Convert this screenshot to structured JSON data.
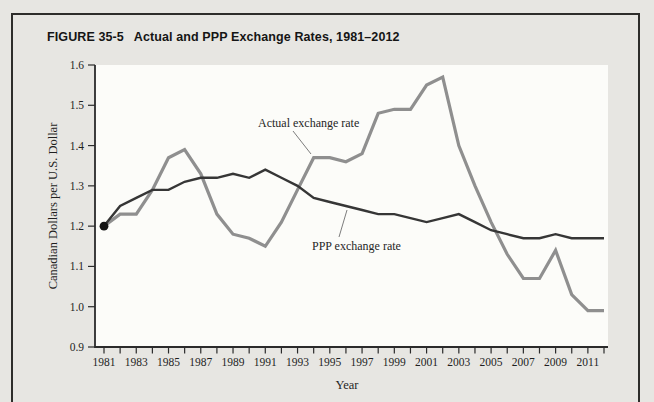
{
  "figure": {
    "label": "FIGURE 35-5",
    "title": "Actual and PPP Exchange Rates, 1981–2012"
  },
  "chart_data": {
    "type": "line",
    "title": "Actual and PPP Exchange Rates, 1981–2012",
    "xlabel": "Year",
    "ylabel": "Canadian Dollars per U.S. Dollar",
    "xlim": [
      1981,
      2012
    ],
    "ylim": [
      0.9,
      1.6
    ],
    "grid": false,
    "legend_position": "inline-annotations",
    "y_tick_labels": [
      "1.6",
      "1.5",
      "1.4",
      "1.3",
      "1.2",
      "1.1",
      "1.0",
      "0.9"
    ],
    "x_tick_labels": [
      "1981",
      "1983",
      "1985",
      "1987",
      "1989",
      "1991",
      "1993",
      "1995",
      "1997",
      "1999",
      "2001",
      "2003",
      "2005",
      "2007",
      "2009",
      "2011"
    ],
    "x_minor_tick_every_year": true,
    "years": [
      1981,
      1982,
      1983,
      1984,
      1985,
      1986,
      1987,
      1988,
      1989,
      1990,
      1991,
      1992,
      1993,
      1994,
      1995,
      1996,
      1997,
      1998,
      1999,
      2000,
      2001,
      2002,
      2003,
      2004,
      2005,
      2006,
      2007,
      2008,
      2009,
      2010,
      2011,
      2012
    ],
    "series": [
      {
        "name": "Actual exchange rate",
        "color": "#8f8f8f",
        "stroke_width": 3.2,
        "values": [
          1.2,
          1.23,
          1.23,
          1.29,
          1.37,
          1.39,
          1.33,
          1.23,
          1.18,
          1.17,
          1.15,
          1.21,
          1.29,
          1.37,
          1.37,
          1.36,
          1.38,
          1.48,
          1.49,
          1.49,
          1.55,
          1.57,
          1.4,
          1.3,
          1.21,
          1.13,
          1.07,
          1.07,
          1.14,
          1.03,
          0.99,
          0.99
        ]
      },
      {
        "name": "PPP exchange rate",
        "color": "#363636",
        "stroke_width": 2.4,
        "values": [
          1.2,
          1.25,
          1.27,
          1.29,
          1.29,
          1.31,
          1.32,
          1.32,
          1.33,
          1.32,
          1.34,
          1.32,
          1.3,
          1.27,
          1.26,
          1.25,
          1.24,
          1.23,
          1.23,
          1.22,
          1.21,
          1.22,
          1.23,
          1.21,
          1.19,
          1.18,
          1.17,
          1.17,
          1.18,
          1.17,
          1.17,
          1.17
        ]
      }
    ],
    "annotations": [
      {
        "text": "Actual exchange rate",
        "points_to_series": "Actual exchange rate",
        "points_to_year": 1994
      },
      {
        "text": "PPP exchange rate",
        "points_to_series": "PPP exchange rate",
        "points_to_year": 1996
      }
    ],
    "start_marker": {
      "year": 1981,
      "value": 1.2,
      "color": "#141414"
    }
  }
}
